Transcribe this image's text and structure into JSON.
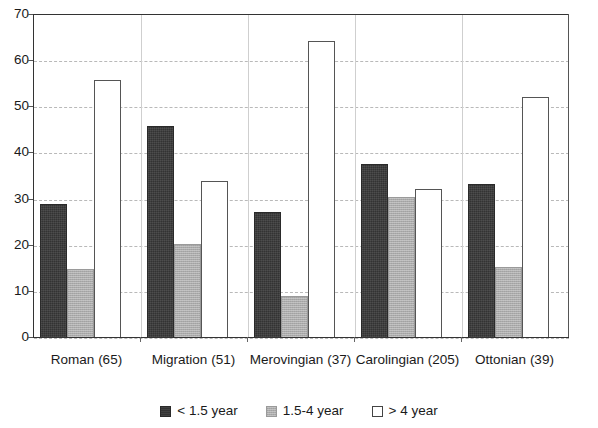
{
  "chart_data": {
    "type": "bar",
    "title": "",
    "subtitle": "",
    "xlabel": "",
    "ylabel": "",
    "ylim": [
      0,
      70
    ],
    "yticks": [
      0,
      10,
      20,
      30,
      40,
      50,
      60,
      70
    ],
    "ytick_labels": [
      "0",
      "10",
      "20",
      "30",
      "40",
      "50",
      "60",
      "70"
    ],
    "grid": true,
    "grid_axis": "y",
    "grid_style": "dashed",
    "legend_position": "bottom",
    "categories": [
      "Roman (65)",
      "Migration (51)",
      "Merovingian (37)",
      "Carolingian (205)",
      "Ottonian (39)"
    ],
    "series": [
      {
        "name": "< 1.5 year",
        "color": "#333333",
        "values": [
          29.0,
          46.0,
          27.3,
          37.8,
          33.3
        ]
      },
      {
        "name": "1.5-4 year",
        "color": "#ababab",
        "values": [
          15.0,
          20.3,
          9.0,
          30.6,
          15.3
        ]
      },
      {
        "name": "> 4 year",
        "color": "#ffffff",
        "values": [
          56.0,
          34.0,
          64.3,
          32.2,
          52.3
        ]
      }
    ]
  },
  "axis": {
    "y_tick_labels": [
      "70",
      "60",
      "50",
      "40",
      "30",
      "20",
      "10",
      "0"
    ],
    "x_tick_labels": [
      "Roman (65)",
      "Migration (51)",
      "Merovingian (37)",
      "Carolingian (205)",
      "Ottonian (39)"
    ]
  },
  "legend": {
    "entries": [
      {
        "label": "< 1.5 year",
        "swatch": "dark-filled-square"
      },
      {
        "label": "1.5-4 year",
        "swatch": "gray-filled-square"
      },
      {
        "label": "> 4 year",
        "swatch": "white-outlined-square"
      }
    ]
  },
  "colors": {
    "series_1": "#333333",
    "series_2": "#ababab",
    "series_3": "#ffffff",
    "gridline": "#b9b9b9",
    "axis": "#333333",
    "text": "#1a1a1a",
    "background": "#ffffff"
  }
}
